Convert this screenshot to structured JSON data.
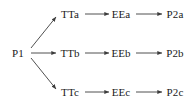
{
  "diagram": {
    "type": "flow-tree",
    "background_color": "#ffffff",
    "stroke_color": "#3c3c3c",
    "text_color": "#1a1a1a",
    "root": {
      "id": "p1",
      "label": "P1",
      "x": 18,
      "y": 53
    },
    "nodes": [
      {
        "id": "tta",
        "label": "TTa",
        "x": 70,
        "y": 14,
        "row": 0,
        "col": 0
      },
      {
        "id": "eea",
        "label": "EEa",
        "x": 121,
        "y": 14,
        "row": 0,
        "col": 1
      },
      {
        "id": "p2a",
        "label": "P2a",
        "x": 175,
        "y": 14,
        "row": 0,
        "col": 2
      },
      {
        "id": "ttb",
        "label": "TTb",
        "x": 70,
        "y": 53,
        "row": 1,
        "col": 0
      },
      {
        "id": "eeb",
        "label": "EEb",
        "x": 121,
        "y": 53,
        "row": 1,
        "col": 1
      },
      {
        "id": "p2b",
        "label": "P2b",
        "x": 175,
        "y": 53,
        "row": 1,
        "col": 2
      },
      {
        "id": "ttc",
        "label": "TTc",
        "x": 70,
        "y": 92,
        "row": 2,
        "col": 0
      },
      {
        "id": "eec",
        "label": "EEc",
        "x": 121,
        "y": 92,
        "row": 2,
        "col": 1
      },
      {
        "id": "p2c",
        "label": "P2c",
        "x": 175,
        "y": 92,
        "row": 2,
        "col": 2
      }
    ],
    "edges": [
      {
        "id": "p1-tta",
        "from": "P1",
        "to": "TTa",
        "x1": 31,
        "y1": 48,
        "x2": 56,
        "y2": 17
      },
      {
        "id": "p1-ttb",
        "from": "P1",
        "to": "TTb",
        "x1": 31,
        "y1": 53,
        "x2": 56,
        "y2": 53
      },
      {
        "id": "p1-ttc",
        "from": "P1",
        "to": "TTc",
        "x1": 31,
        "y1": 58,
        "x2": 56,
        "y2": 89
      },
      {
        "id": "tta-eea",
        "from": "TTa",
        "to": "EEa",
        "x1": 85,
        "y1": 14,
        "x2": 109,
        "y2": 14
      },
      {
        "id": "eea-p2a",
        "from": "EEa",
        "to": "P2a",
        "x1": 136,
        "y1": 14,
        "x2": 162,
        "y2": 14
      },
      {
        "id": "ttb-eeb",
        "from": "TTb",
        "to": "EEb",
        "x1": 85,
        "y1": 53,
        "x2": 109,
        "y2": 53
      },
      {
        "id": "eeb-p2b",
        "from": "EEb",
        "to": "P2b",
        "x1": 136,
        "y1": 53,
        "x2": 162,
        "y2": 53
      },
      {
        "id": "ttc-eec",
        "from": "TTc",
        "to": "EEc",
        "x1": 85,
        "y1": 92,
        "x2": 109,
        "y2": 92
      },
      {
        "id": "eec-p2c",
        "from": "EEc",
        "to": "P2c",
        "x1": 136,
        "y1": 92,
        "x2": 162,
        "y2": 92
      }
    ]
  }
}
